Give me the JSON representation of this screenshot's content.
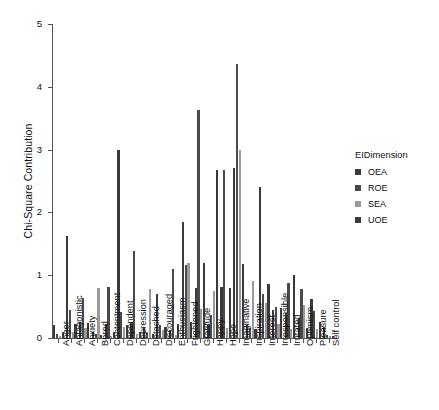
{
  "chart_data": {
    "type": "bar",
    "title": "",
    "xlabel": "",
    "ylabel": "Chi-Square Contribution",
    "ylim": [
      0,
      5
    ],
    "ytick_labels": [
      "0",
      "1",
      "2",
      "3",
      "4",
      "5"
    ],
    "ytick_values": [
      0,
      1,
      2,
      3,
      4,
      5
    ],
    "grid": false,
    "legend_position": "right",
    "legend_title": "EIDimension",
    "categories": [
      "Anger",
      "Antagonistic",
      "Anxiety",
      "Bored",
      "Contentment",
      "Dependent",
      "Depression",
      "Detached",
      "Discouraged",
      "Enthusiasm",
      "Frightened",
      "Gratitude",
      "Happy",
      "Hope",
      "Imaginative",
      "Inspiration",
      "Interest",
      "Irresponsible",
      "Irritated",
      "Optimism",
      "Pleasure",
      "Self control"
    ],
    "series": [
      {
        "name": "OEA",
        "color": "#3a3a3a",
        "values": [
          0.2,
          1.62,
          0.26,
          0.1,
          0.22,
          2.99,
          0.25,
          0.18,
          0.7,
          0.12,
          1.85,
          0.8,
          0.2,
          0.82,
          2.7,
          0.2,
          2.41,
          0.45,
          0.4,
          0.32,
          0.62,
          0.17
        ]
      },
      {
        "name": "ROE",
        "color": "#4a4a4a",
        "values": [
          0.06,
          0.44,
          0.63,
          0.06,
          0.82,
          0.42,
          1.38,
          0.08,
          0.2,
          1.1,
          1.17,
          3.63,
          0.36,
          2.68,
          4.36,
          0.16,
          0.7,
          0.5,
          0.88,
          0.78,
          0.43,
          0.05
        ]
      },
      {
        "name": "SEA",
        "color": "#9a9a9a",
        "values": [
          0.04,
          0.1,
          0.16,
          0.8,
          0.04,
          0.18,
          0.06,
          0.78,
          0.12,
          0.05,
          1.2,
          0.46,
          0.75,
          0.16,
          2.99,
          0.9,
          0.55,
          0.23,
          0.14,
          0.52,
          0.14,
          0.04
        ]
      },
      {
        "name": "UOE",
        "color": "#3a3a3a",
        "values": [
          0.1,
          0.22,
          0.24,
          0.05,
          0.1,
          0.2,
          0.1,
          0.06,
          0.18,
          0.22,
          0.26,
          1.2,
          2.68,
          0.8,
          1.18,
          0.14,
          0.86,
          0.48,
          1.0,
          0.16,
          0.26,
          0.04
        ]
      }
    ]
  },
  "legend": {
    "title": "EIDimension",
    "items": [
      {
        "label": "OEA",
        "color": "#3a3a3a"
      },
      {
        "label": "ROE",
        "color": "#4a4a4a"
      },
      {
        "label": "SEA",
        "color": "#9a9a9a"
      },
      {
        "label": "UOE",
        "color": "#3a3a3a"
      }
    ]
  },
  "axes": {
    "y_title": "Chi-Square Contribution"
  }
}
